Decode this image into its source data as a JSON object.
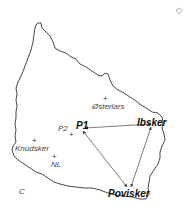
{
  "map": {
    "type": "island outline map with route triangle",
    "places": [
      {
        "id": "osterlars",
        "label": "Østerlars",
        "style": "regular"
      },
      {
        "id": "knudsker",
        "label": "Knudsker",
        "style": "regular"
      },
      {
        "id": "nl",
        "label": "NL",
        "style": "regular"
      },
      {
        "id": "p2",
        "label": "P2",
        "style": "regular"
      },
      {
        "id": "p1",
        "label": "P1",
        "style": "bold"
      },
      {
        "id": "ibsker",
        "label": "Ibsker",
        "style": "bold"
      },
      {
        "id": "povisker",
        "label": "Povisker",
        "style": "bold"
      }
    ],
    "corner_label": "C",
    "routes": [
      {
        "from": "P1",
        "to": "Ibsker",
        "arrows": "both"
      },
      {
        "from": "P1",
        "to": "Povisker",
        "arrows": "both"
      },
      {
        "from": "Ibsker",
        "to": "Povisker",
        "arrows": "both"
      }
    ],
    "colors": {
      "outline": "#333333",
      "routes": "#444444",
      "background": "#ffffff"
    }
  }
}
